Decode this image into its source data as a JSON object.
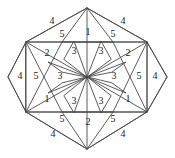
{
  "figure": {
    "shape": "hexagon",
    "symmetry_order": 6,
    "stroke_color": "#4a4a4a",
    "background_color": "#ffffff",
    "label_color": "#1a1a1a",
    "piece_count": 30,
    "distinct_piece_types": 5
  },
  "geometry": {
    "center": {
      "x": 87,
      "y": 77
    },
    "hexagon_vertices": [
      {
        "x": 87,
        "y": 8
      },
      {
        "x": 147,
        "y": 42
      },
      {
        "x": 147,
        "y": 112
      },
      {
        "x": 87,
        "y": 149
      },
      {
        "x": 26,
        "y": 112
      },
      {
        "x": 26,
        "y": 42
      }
    ],
    "inner_rectangle": [
      {
        "x": 26,
        "y": 42
      },
      {
        "x": 147,
        "y": 42
      },
      {
        "x": 147,
        "y": 112
      },
      {
        "x": 26,
        "y": 112
      }
    ],
    "left_tip": {
      "x": 8,
      "y": 77
    },
    "right_tip": {
      "x": 167,
      "y": 77
    }
  },
  "labels": {
    "top_left_outer": "4",
    "top_right_outer": "4",
    "top_left_inner": "5",
    "top_center": "1",
    "top_right_inner": "5",
    "upper_left_two": "2",
    "upper_left_three": "3",
    "upper_right_three": "3",
    "upper_right_two": "2",
    "left_outer_four": "4",
    "left_five": "5",
    "left_center_three": "3",
    "right_center_three": "3",
    "right_five": "5",
    "right_outer_four": "4",
    "lower_left_one": "1",
    "lower_left_three": "3",
    "lower_right_three": "3",
    "lower_right_one": "1",
    "bottom_left_inner": "5",
    "bottom_center": "2",
    "bottom_right_inner": "5",
    "bottom_left_outer": "4",
    "bottom_right_outer": "4"
  },
  "label_positions": [
    {
      "key": "top_left_outer",
      "text": "4",
      "x": 52,
      "y": 22
    },
    {
      "key": "top_right_outer",
      "text": "4",
      "x": 123,
      "y": 22
    },
    {
      "key": "top_left_inner",
      "text": "5",
      "x": 62,
      "y": 35
    },
    {
      "key": "top_center",
      "text": "1",
      "x": 88,
      "y": 33
    },
    {
      "key": "top_right_inner",
      "text": "5",
      "x": 113,
      "y": 35
    },
    {
      "key": "upper_left_two",
      "text": "2",
      "x": 47,
      "y": 54
    },
    {
      "key": "upper_left_three",
      "text": "3",
      "x": 74,
      "y": 52
    },
    {
      "key": "upper_right_three",
      "text": "3",
      "x": 101,
      "y": 52
    },
    {
      "key": "upper_right_two",
      "text": "2",
      "x": 128,
      "y": 54
    },
    {
      "key": "left_outer_four",
      "text": "4",
      "x": 20,
      "y": 77
    },
    {
      "key": "left_five",
      "text": "5",
      "x": 36,
      "y": 77
    },
    {
      "key": "left_center_three",
      "text": "3",
      "x": 60,
      "y": 77
    },
    {
      "key": "right_center_three",
      "text": "3",
      "x": 114,
      "y": 77
    },
    {
      "key": "right_five",
      "text": "5",
      "x": 139,
      "y": 77
    },
    {
      "key": "right_outer_four",
      "text": "4",
      "x": 155,
      "y": 77
    },
    {
      "key": "lower_left_one",
      "text": "1",
      "x": 47,
      "y": 100
    },
    {
      "key": "lower_left_three",
      "text": "3",
      "x": 74,
      "y": 102
    },
    {
      "key": "lower_right_three",
      "text": "3",
      "x": 101,
      "y": 102
    },
    {
      "key": "lower_right_one",
      "text": "1",
      "x": 128,
      "y": 100
    },
    {
      "key": "bottom_left_inner",
      "text": "5",
      "x": 62,
      "y": 120
    },
    {
      "key": "bottom_center",
      "text": "2",
      "x": 88,
      "y": 123
    },
    {
      "key": "bottom_right_inner",
      "text": "5",
      "x": 113,
      "y": 120
    },
    {
      "key": "bottom_left_outer",
      "text": "4",
      "x": 53,
      "y": 135
    },
    {
      "key": "bottom_right_outer",
      "text": "4",
      "x": 123,
      "y": 135
    }
  ],
  "paths": {
    "hexagon_outline": "M87,8 L147,42 L167,77 L147,112 L87,149 L26,112 L8,77 L26,42 Z",
    "outer_hexagon": "M87,8 L147,42 L167,77 L147,112 L87,149 L26,112 L8,77 L26,42 Z",
    "inner_rect": "M26,42 L147,42 L147,112 L26,112 Z",
    "spokes": [
      "M87,77 L87,8",
      "M87,77 L147,42",
      "M87,77 L147,112",
      "M87,77 L87,149",
      "M87,77 L26,112",
      "M87,77 L26,42"
    ],
    "left_tip_edges": "M8,77 L26,42 M8,77 L26,112",
    "right_tip_edges": "M167,77 L147,42 M167,77 L147,112",
    "fan_top": "M87,8 L62,42 M87,8 L113,42",
    "fan_bottom": "M87,149 L62,112 M87,149 L113,112",
    "diag_tl": "M26,42 L87,8",
    "diag_tr": "M147,42 L87,8",
    "diag_bl": "M26,112 L87,149",
    "diag_br": "M147,112 L87,149",
    "long_tl": "M26,42 L113,42",
    "long_tr": "M147,42 L62,42",
    "long_bl": "M26,112 L113,112",
    "long_br": "M147,112 L62,112",
    "corner_diag_tl": "M26,42 L87,77",
    "dart_1": "M87,77 L73,40 L64,57 Z",
    "dart_2": "M87,77 L103,40 L111,57 Z",
    "dart_3": "M87,77 L124,62 L111,72 Z",
    "dart_4": "M87,77 L124,93 L111,83 Z",
    "dart_5": "M87,77 L103,114 L111,97 Z",
    "dart_6": "M87,77 L73,114 L64,97 Z"
  },
  "pieces": [
    {
      "id": 1,
      "label": "4",
      "sector": "top",
      "position": "outer-left"
    },
    {
      "id": 2,
      "label": "4",
      "sector": "top",
      "position": "outer-right"
    },
    {
      "id": 3,
      "label": "5",
      "sector": "top",
      "position": "inner-left"
    },
    {
      "id": 4,
      "label": "1",
      "sector": "top",
      "position": "center"
    },
    {
      "id": 5,
      "label": "5",
      "sector": "top",
      "position": "inner-right"
    },
    {
      "id": 6,
      "label": "2",
      "sector": "upper-left",
      "position": "band"
    },
    {
      "id": 7,
      "label": "3",
      "sector": "upper-left",
      "position": "dart"
    },
    {
      "id": 8,
      "label": "3",
      "sector": "upper-right",
      "position": "dart"
    },
    {
      "id": 9,
      "label": "2",
      "sector": "upper-right",
      "position": "band"
    },
    {
      "id": 10,
      "label": "4",
      "sector": "left",
      "position": "tip"
    },
    {
      "id": 11,
      "label": "5",
      "sector": "left",
      "position": "band"
    },
    {
      "id": 12,
      "label": "3",
      "sector": "left",
      "position": "dart"
    },
    {
      "id": 13,
      "label": "3",
      "sector": "right",
      "position": "dart"
    },
    {
      "id": 14,
      "label": "5",
      "sector": "right",
      "position": "band"
    },
    {
      "id": 15,
      "label": "4",
      "sector": "right",
      "position": "tip"
    },
    {
      "id": 16,
      "label": "1",
      "sector": "lower-left",
      "position": "band"
    },
    {
      "id": 17,
      "label": "3",
      "sector": "lower-left",
      "position": "dart"
    },
    {
      "id": 18,
      "label": "3",
      "sector": "lower-right",
      "position": "dart"
    },
    {
      "id": 19,
      "label": "1",
      "sector": "lower-right",
      "position": "band"
    },
    {
      "id": 20,
      "label": "5",
      "sector": "bottom",
      "position": "inner-left"
    },
    {
      "id": 21,
      "label": "2",
      "sector": "bottom",
      "position": "center"
    },
    {
      "id": 22,
      "label": "5",
      "sector": "bottom",
      "position": "inner-right"
    },
    {
      "id": 23,
      "label": "4",
      "sector": "bottom",
      "position": "outer-left"
    },
    {
      "id": 24,
      "label": "4",
      "sector": "bottom",
      "position": "outer-right"
    }
  ]
}
